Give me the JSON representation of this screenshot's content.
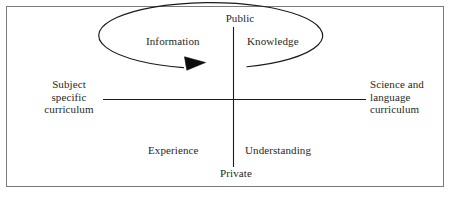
{
  "figure": {
    "frame_color": "#7a7a7a",
    "line_color": "#1a1a1a",
    "background": "#ffffff"
  },
  "axes": {
    "vertical": {
      "top_label": "Public",
      "bottom_label": "Private"
    },
    "horizontal": {
      "left_label_lines": [
        "Subject",
        "specific",
        "curriculum"
      ],
      "left_label": "Subject specific curriculum",
      "right_label_lines": [
        "Science and",
        "language",
        "curriculum"
      ],
      "right_label": "Science and language curriculum"
    }
  },
  "quadrants": [
    {
      "name": "top-left",
      "label": "Information"
    },
    {
      "name": "top-right",
      "label": "Knowledge"
    },
    {
      "name": "bottom-left",
      "label": "Experience"
    },
    {
      "name": "bottom-right",
      "label": "Understanding"
    }
  ],
  "quadrant_labels": {
    "top_left": "Information",
    "top_right": "Knowledge",
    "bottom_left": "Experience",
    "bottom_right": "Understanding"
  },
  "cycle": {
    "shape": "ellipse",
    "direction": "clockwise",
    "arrow": "solid-triangle-pointing-right",
    "gap_position": "top-right"
  }
}
